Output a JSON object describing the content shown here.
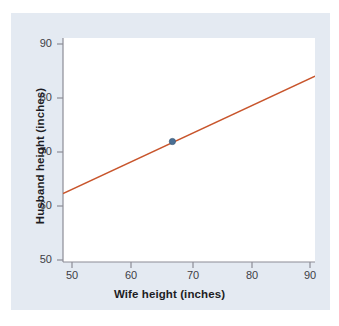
{
  "chart_data": {
    "type": "line",
    "title": "",
    "xlabel": "Wife height (inches)",
    "ylabel": "Husband height (inches)",
    "xlim": [
      48.2,
      91.5
    ],
    "ylim": [
      48.0,
      91.5
    ],
    "xticks": [
      50,
      60,
      70,
      80,
      90
    ],
    "yticks": [
      50,
      60,
      70,
      80,
      90
    ],
    "xtick_labels": [
      "50",
      "60",
      "70",
      "80",
      "90"
    ],
    "ytick_labels": [
      "50",
      "60",
      "70",
      "80",
      "90"
    ],
    "grid": false,
    "legend": "none",
    "series": [
      {
        "name": "regression-line",
        "type": "line",
        "color": "#c8552c",
        "x": [
          48.2,
          91.5
        ],
        "y": [
          61.3,
          84.1
        ]
      },
      {
        "name": "mean-point",
        "type": "scatter",
        "color": "#4a6f94",
        "x": [
          67.0
        ],
        "y": [
          71.4
        ]
      }
    ],
    "annotations": []
  },
  "figure": {
    "panel_color": "#e4eaf2",
    "plot_background": "#ffffff",
    "axis_color": "#8c8c96",
    "line_color": "#c8552c",
    "point_color": "#4a6f94",
    "text_color": "#1d1d24",
    "tick_text_color": "#3e3e46"
  }
}
